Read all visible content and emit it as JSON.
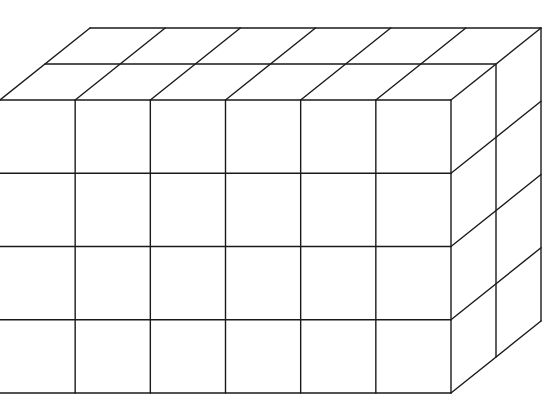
{
  "diagram": {
    "type": "rectangular-prism-of-unit-cubes",
    "dimensions": {
      "length": 6,
      "height": 4,
      "depth": 2
    },
    "total_cubes": 48,
    "line_color": "#1a1a1a",
    "background": "#ffffff",
    "caption": "Rectangular prism built from unit cubes: 6 long, 4 high, 2 deep"
  }
}
